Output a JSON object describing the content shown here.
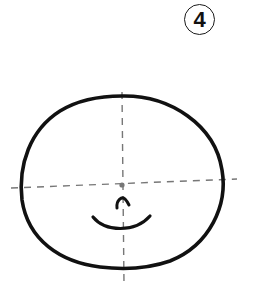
{
  "figure": {
    "step_label": "4",
    "colors": {
      "background": "#ffffff",
      "outline": "#111111",
      "guide_lines": "#777777",
      "center_dot": "#777777"
    },
    "elements": [
      {
        "name": "head-outline",
        "type": "closed-curve"
      },
      {
        "name": "vertical-guide",
        "type": "dashed-line"
      },
      {
        "name": "horizontal-guide",
        "type": "dashed-line"
      },
      {
        "name": "center-dot",
        "type": "dot"
      },
      {
        "name": "nose",
        "type": "arc"
      },
      {
        "name": "mouth",
        "type": "arc"
      }
    ]
  }
}
